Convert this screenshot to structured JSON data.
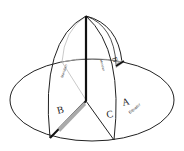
{
  "diagram": {
    "labels": {
      "A": "A",
      "B": "B",
      "C": "C",
      "B_back": "B",
      "equator": "Equator",
      "meridian_left": "Meridian",
      "meridian_center": "Meridian"
    },
    "colors": {
      "stroke": "#222222",
      "light_stroke": "#bbbbbb",
      "shade": "#aaaaaa",
      "background": "#ffffff"
    }
  }
}
